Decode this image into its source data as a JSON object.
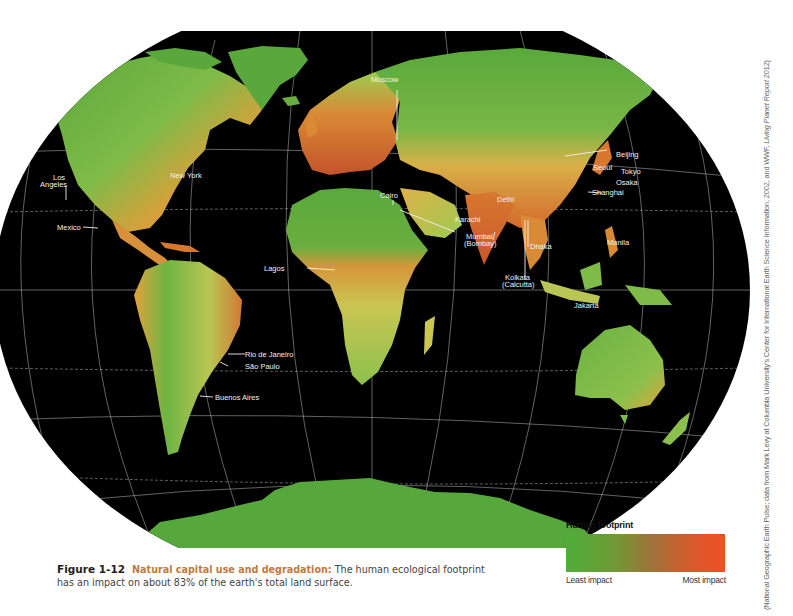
{
  "figure": {
    "number": "Figure 1-12",
    "title": "Natural capital use and degradation:",
    "description": "The human ecological footprint has an impact on about 83% of the earth's total land surface."
  },
  "legend": {
    "title": "Human footprint",
    "low_label": "Least impact",
    "high_label": "Most impact",
    "colors": {
      "least": "#4fae3a",
      "mid": "#a0713a",
      "most": "#ef4f24"
    }
  },
  "credit": {
    "text_before": "(National Geographic Earth Pulse; data from Mark Levy at Columbia University's Center for International Earth Science Information, 2002, and WWF, ",
    "report": "Living Planet Report",
    "text_after": " 2012)"
  },
  "map": {
    "background": "#000000",
    "land_colors": {
      "low": "#5aa83c",
      "light": "#b9d35a",
      "mid": "#e0a23a",
      "high": "#c8562a"
    },
    "cities": [
      {
        "name": "Moscow"
      },
      {
        "name": "Los Angeles",
        "line1": "Los",
        "line2": "Angeles"
      },
      {
        "name": "New York"
      },
      {
        "name": "Mexico"
      },
      {
        "name": "Cairo"
      },
      {
        "name": "Karachi"
      },
      {
        "name": "Delhi"
      },
      {
        "name": "Mumbai (Bombay)",
        "line1": "Mumbai",
        "line2": "(Bombay)"
      },
      {
        "name": "Kolkata (Calcutta)",
        "line1": "Kolkata",
        "line2": "(Calcutta)"
      },
      {
        "name": "Dhaka"
      },
      {
        "name": "Beijing"
      },
      {
        "name": "Seoul"
      },
      {
        "name": "Tokyo"
      },
      {
        "name": "Osaka"
      },
      {
        "name": "Shanghai"
      },
      {
        "name": "Manila"
      },
      {
        "name": "Jakarta"
      },
      {
        "name": "Lagos"
      },
      {
        "name": "Rio de Janeiro"
      },
      {
        "name": "São Paulo"
      },
      {
        "name": "Buenos Aires"
      }
    ]
  }
}
